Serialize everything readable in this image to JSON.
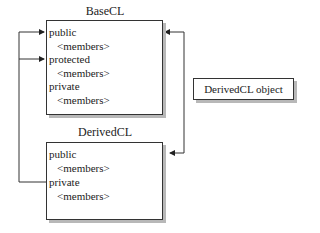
{
  "base_class": {
    "title": "BaseCL",
    "rows": [
      "public",
      "<members>",
      "protected",
      "<members>",
      "private",
      "<members>"
    ]
  },
  "derived_class": {
    "title": "DerivedCL",
    "rows": [
      "public",
      "<members>",
      "private",
      "<members>"
    ]
  },
  "object_box": {
    "label": "DerivedCL object"
  },
  "colors": {
    "line": "#333333",
    "shadow": "#b8b8b8"
  }
}
